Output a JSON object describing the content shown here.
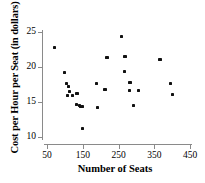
{
  "chart_data": {
    "type": "scatter",
    "title": "",
    "xlabel": "Number of Seats",
    "ylabel": "Cost per Hour per Seat (in dollars)",
    "xlim": [
      40,
      460
    ],
    "ylim": [
      9.2,
      25.6
    ],
    "xticks": [
      50,
      150,
      250,
      350,
      450
    ],
    "yticks": [
      10,
      15,
      20,
      25
    ],
    "xtick_labels": [
      "50",
      "150",
      "250",
      "350",
      "450"
    ],
    "ytick_labels": [
      "10",
      "15",
      "20",
      "25"
    ],
    "grid": false,
    "legend": false,
    "marker": "square",
    "marker_color": "#111111",
    "axis_color": "#8a8a8a",
    "points": [
      {
        "x": 72,
        "y": 22.8
      },
      {
        "x": 100,
        "y": 19.2
      },
      {
        "x": 104,
        "y": 17.6
      },
      {
        "x": 110,
        "y": 17.2
      },
      {
        "x": 112,
        "y": 16.5
      },
      {
        "x": 108,
        "y": 15.9
      },
      {
        "x": 122,
        "y": 15.9
      },
      {
        "x": 134,
        "y": 16.2
      },
      {
        "x": 132,
        "y": 14.7
      },
      {
        "x": 140,
        "y": 14.5
      },
      {
        "x": 144,
        "y": 14.4
      },
      {
        "x": 150,
        "y": 14.3
      },
      {
        "x": 150,
        "y": 11.2
      },
      {
        "x": 188,
        "y": 17.6
      },
      {
        "x": 192,
        "y": 14.2
      },
      {
        "x": 212,
        "y": 16.8
      },
      {
        "x": 218,
        "y": 21.4
      },
      {
        "x": 258,
        "y": 24.4
      },
      {
        "x": 268,
        "y": 21.5
      },
      {
        "x": 266,
        "y": 19.3
      },
      {
        "x": 282,
        "y": 17.8
      },
      {
        "x": 280,
        "y": 16.6
      },
      {
        "x": 292,
        "y": 14.5
      },
      {
        "x": 306,
        "y": 16.7
      },
      {
        "x": 366,
        "y": 21.1
      },
      {
        "x": 396,
        "y": 17.7
      },
      {
        "x": 402,
        "y": 16.1
      }
    ]
  }
}
